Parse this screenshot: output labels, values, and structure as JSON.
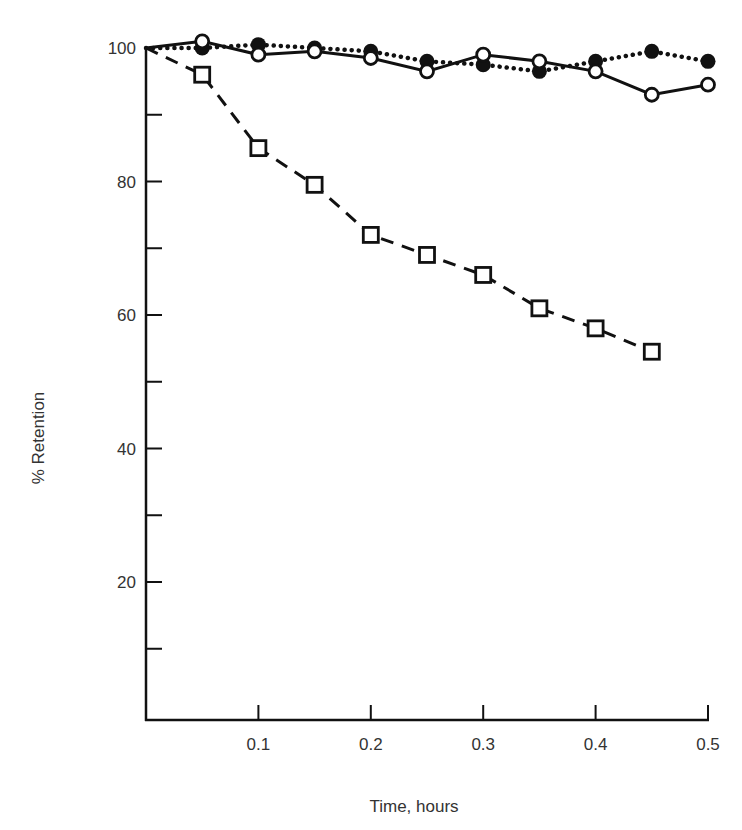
{
  "chart_data": {
    "type": "line",
    "title": "",
    "xlabel": "Time, hours",
    "ylabel": "% Retention",
    "xlim": [
      0,
      0.5
    ],
    "ylim": [
      0,
      100
    ],
    "grid": false,
    "legend": null,
    "x_ticks": [
      0.1,
      0.2,
      0.3,
      0.4,
      0.5
    ],
    "x_tick_labels": [
      "0.1",
      "0.2",
      "0.3",
      "0.4",
      "0.5"
    ],
    "y_ticks_major": [
      20,
      40,
      60,
      80,
      100
    ],
    "y_tick_labels": [
      "20",
      "40",
      "60",
      "80",
      "100"
    ],
    "y_ticks_minor": [
      10,
      30,
      50,
      70,
      90
    ],
    "series": [
      {
        "name": "filled circles (dotted line)",
        "marker": "filled-circle",
        "line": "dotted",
        "x": [
          0,
          0.05,
          0.1,
          0.15,
          0.2,
          0.25,
          0.3,
          0.35,
          0.4,
          0.45,
          0.5
        ],
        "values": [
          100,
          100,
          100.5,
          100,
          99.5,
          98,
          97.5,
          96.5,
          98,
          99.5,
          98
        ]
      },
      {
        "name": "open circles (solid line)",
        "marker": "open-circle",
        "line": "solid",
        "x": [
          0,
          0.05,
          0.1,
          0.15,
          0.2,
          0.25,
          0.3,
          0.35,
          0.4,
          0.45,
          0.5
        ],
        "values": [
          100,
          101,
          99,
          99.5,
          98.5,
          96.5,
          99,
          98,
          96.5,
          93,
          94.5
        ]
      },
      {
        "name": "open squares (dashed line)",
        "marker": "open-square",
        "line": "dashed",
        "x": [
          0,
          0.05,
          0.1,
          0.15,
          0.2,
          0.25,
          0.3,
          0.35,
          0.4,
          0.45
        ],
        "values": [
          100,
          96,
          85,
          79.5,
          72,
          69,
          66,
          61,
          58,
          54.5
        ]
      }
    ]
  },
  "colors": {
    "ink": "#111111",
    "text": "#333333",
    "background": "#ffffff"
  }
}
